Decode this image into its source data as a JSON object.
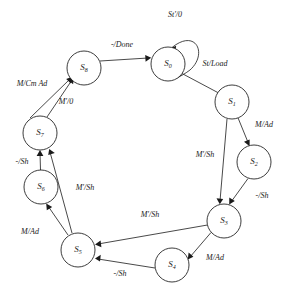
{
  "diagram": {
    "kind": "state-transition-diagram",
    "title": "",
    "background_color": "#ffffff",
    "stroke_color": "#1a1a1a"
  },
  "states": [
    {
      "id": "S0",
      "label": "S",
      "sub": "0",
      "cx": 168,
      "cy": 64,
      "r": 17
    },
    {
      "id": "S1",
      "label": "S",
      "sub": "1",
      "cx": 232,
      "cy": 102,
      "r": 17
    },
    {
      "id": "S2",
      "label": "S",
      "sub": "2",
      "cx": 254,
      "cy": 162,
      "r": 17
    },
    {
      "id": "S3",
      "label": "S",
      "sub": "3",
      "cx": 224,
      "cy": 221,
      "r": 17
    },
    {
      "id": "S4",
      "label": "S",
      "sub": "4",
      "cx": 172,
      "cy": 265,
      "r": 17
    },
    {
      "id": "S5",
      "label": "S",
      "sub": "5",
      "cx": 78,
      "cy": 250,
      "r": 17
    },
    {
      "id": "S6",
      "label": "S",
      "sub": "6",
      "cx": 41,
      "cy": 187,
      "r": 17
    },
    {
      "id": "S7",
      "label": "S",
      "sub": "7",
      "cx": 40,
      "cy": 133,
      "r": 17
    },
    {
      "id": "S8",
      "label": "S",
      "sub": "8",
      "cx": 84,
      "cy": 68,
      "r": 17
    }
  ],
  "transitions": [
    {
      "id": "t-s0-s0",
      "from": "S0",
      "to": "S0",
      "label": "St'/0",
      "lx": 175,
      "ly": 15,
      "self_loop": true
    },
    {
      "id": "t-s0-s1",
      "from": "S0",
      "to": "S1",
      "label": "St/Load",
      "lx": 215,
      "ly": 64
    },
    {
      "id": "t-s1-s2",
      "from": "S1",
      "to": "S2",
      "label": "M/Ad",
      "lx": 264,
      "ly": 125
    },
    {
      "id": "t-s1-s3",
      "from": "S1",
      "to": "S3",
      "label": "M'/Sh",
      "lx": 205,
      "ly": 155
    },
    {
      "id": "t-s2-s3",
      "from": "S2",
      "to": "S3",
      "label": "-/Sh",
      "lx": 262,
      "ly": 196
    },
    {
      "id": "t-s3-s4",
      "from": "S3",
      "to": "S4",
      "label": "M/Ad",
      "lx": 215,
      "ly": 258
    },
    {
      "id": "t-s3-s5",
      "from": "S3",
      "to": "S5",
      "label": "M'/Sh",
      "lx": 150,
      "ly": 215
    },
    {
      "id": "t-s4-s5",
      "from": "S4",
      "to": "S5",
      "label": "-/Sh",
      "lx": 120,
      "ly": 274
    },
    {
      "id": "t-s5-s6",
      "from": "S5",
      "to": "S6",
      "label": "M/Ad",
      "lx": 30,
      "ly": 232
    },
    {
      "id": "t-s5-s7",
      "from": "S5",
      "to": "S7",
      "label": "M'/Sh",
      "lx": 85,
      "ly": 188
    },
    {
      "id": "t-s6-s7",
      "from": "S6",
      "to": "S7",
      "label": "-/Sh",
      "lx": 22,
      "ly": 162
    },
    {
      "id": "t-s7-s8",
      "from": "S7",
      "to": "S8",
      "label": "M/Cm Ad",
      "lx": 32,
      "ly": 84
    },
    {
      "id": "t-s7-s8b",
      "from": "S7",
      "to": "S8",
      "label": "M'/0",
      "lx": 66,
      "ly": 102
    },
    {
      "id": "t-s8-s0",
      "from": "S8",
      "to": "S0",
      "label": "-/Done",
      "lx": 122,
      "ly": 45
    }
  ]
}
